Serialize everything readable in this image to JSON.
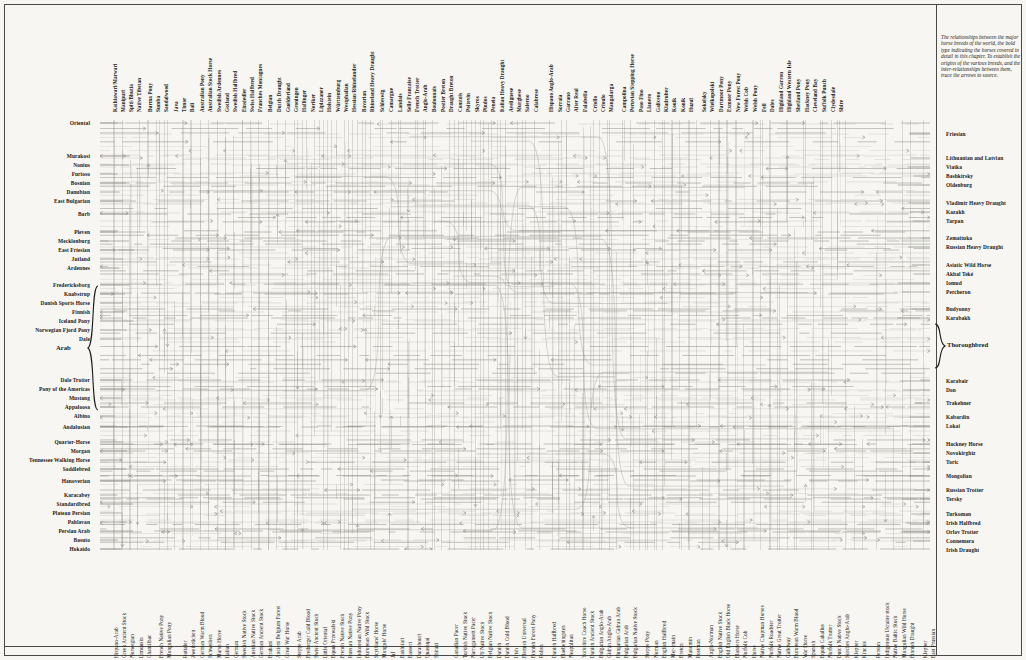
{
  "plate": {
    "title": "Horse Breed Relationship Chart",
    "caption": "The relationships between the major horse breeds of the world, the bold type indicating the horses covered in detail in this chapter. To establish the origins of the various breeds, and the inter-relationships between them, trace the arrows to source.",
    "bg_color": "#f7f6f2",
    "line_color": "#8a8a84",
    "text_color": "#171717",
    "rule_color": "#4a4a46"
  },
  "left_labels": [
    {
      "label": "Oriental",
      "y": 123,
      "bold": true
    },
    {
      "label": "Murakosi",
      "y": 156,
      "bold": true
    },
    {
      "label": "Nonius",
      "y": 165,
      "bold": true
    },
    {
      "label": "Furioso",
      "y": 174,
      "bold": true
    },
    {
      "label": "Bosnian",
      "y": 183,
      "bold": true
    },
    {
      "label": "Danubian",
      "y": 192,
      "bold": true
    },
    {
      "label": "East Bulgarian",
      "y": 201,
      "bold": true
    },
    {
      "label": "Barb",
      "y": 214,
      "bold": true
    },
    {
      "label": "Pleven",
      "y": 232,
      "bold": true
    },
    {
      "label": "Mecklenburg",
      "y": 241,
      "bold": true
    },
    {
      "label": "East Friesian",
      "y": 250,
      "bold": true
    },
    {
      "label": "Jutland",
      "y": 259,
      "bold": true
    },
    {
      "label": "Ardennes",
      "y": 268,
      "bold": true
    },
    {
      "label": "Fredericksborg",
      "y": 285,
      "bold": true
    },
    {
      "label": "Knabstrup",
      "y": 294,
      "bold": true
    },
    {
      "label": "Danish Sports Horse",
      "y": 303,
      "bold": true
    },
    {
      "label": "Finnish",
      "y": 312,
      "bold": true
    },
    {
      "label": "Iceland Pony",
      "y": 321,
      "bold": true
    },
    {
      "label": "Norwegian Fjord Pony",
      "y": 330,
      "bold": true
    },
    {
      "label": "Dale",
      "y": 339,
      "bold": true
    },
    {
      "label": "Dale Trotter",
      "y": 380,
      "bold": true
    },
    {
      "label": "Pony of the Americas",
      "y": 389,
      "bold": true
    },
    {
      "label": "Mustang",
      "y": 398,
      "bold": true
    },
    {
      "label": "Appaloosa",
      "y": 407,
      "bold": true
    },
    {
      "label": "Albino",
      "y": 416,
      "bold": true
    },
    {
      "label": "Andalusian",
      "y": 427,
      "bold": true
    },
    {
      "label": "Quarter-Horse",
      "y": 442,
      "bold": true
    },
    {
      "label": "Morgan",
      "y": 451,
      "bold": true
    },
    {
      "label": "Tennessee Walking Horse",
      "y": 460,
      "bold": true
    },
    {
      "label": "Saddlebred",
      "y": 469,
      "bold": true
    },
    {
      "label": "Hanoverian",
      "y": 481,
      "bold": true
    },
    {
      "label": "Karacabey",
      "y": 495,
      "bold": true
    },
    {
      "label": "Standardbred",
      "y": 504,
      "bold": true
    },
    {
      "label": "Plateau Persian",
      "y": 513,
      "bold": true
    },
    {
      "label": "Pahlavan",
      "y": 522,
      "bold": true
    },
    {
      "label": "Persian Arab",
      "y": 531,
      "bold": true
    },
    {
      "label": "Basuto",
      "y": 540,
      "bold": true
    },
    {
      "label": "Hokaido",
      "y": 549,
      "bold": true
    }
  ],
  "left_brace_label": {
    "label": "Arab",
    "y": 348
  },
  "right_brace_label": {
    "label": "Thoroughbred",
    "y": 343
  },
  "right_labels": [
    {
      "label": "Friesian",
      "y": 134,
      "bold": true
    },
    {
      "label": "Lithuanian and Latvian",
      "y": 158,
      "bold": true
    },
    {
      "label": "Viatka",
      "y": 167,
      "bold": true
    },
    {
      "label": "Bashkirsky",
      "y": 176,
      "bold": true
    },
    {
      "label": "Oldenburg",
      "y": 185,
      "bold": true
    },
    {
      "label": "Vladimir Heavy Draught",
      "y": 203,
      "bold": true
    },
    {
      "label": "Kazakh",
      "y": 212,
      "bold": true
    },
    {
      "label": "Tarpan",
      "y": 221,
      "bold": true
    },
    {
      "label": "Zemaituka",
      "y": 238,
      "bold": true
    },
    {
      "label": "Russian Heavy Draught",
      "y": 247,
      "bold": true
    },
    {
      "label": "Asiatic Wild Horse",
      "y": 265,
      "bold": true
    },
    {
      "label": "Akhal Teké",
      "y": 274,
      "bold": true
    },
    {
      "label": "Iomud",
      "y": 283,
      "bold": true
    },
    {
      "label": "Percheron",
      "y": 292,
      "bold": true
    },
    {
      "label": "Budyonny",
      "y": 309,
      "bold": true
    },
    {
      "label": "Karabakh",
      "y": 318,
      "bold": true
    },
    {
      "label": "Karabair",
      "y": 381,
      "bold": true
    },
    {
      "label": "Don",
      "y": 390,
      "bold": true
    },
    {
      "label": "Trakehner",
      "y": 403,
      "bold": true
    },
    {
      "label": "Kabardin",
      "y": 417,
      "bold": true
    },
    {
      "label": "Lokai",
      "y": 426,
      "bold": true
    },
    {
      "label": "Hackney Horse",
      "y": 444,
      "bold": true
    },
    {
      "label": "Novokirghiz",
      "y": 453,
      "bold": true
    },
    {
      "label": "Toric",
      "y": 462,
      "bold": true
    },
    {
      "label": "Mongolian",
      "y": 476,
      "bold": true
    },
    {
      "label": "Russian Trotter",
      "y": 490,
      "bold": true
    },
    {
      "label": "Tersky",
      "y": 499,
      "bold": true
    },
    {
      "label": "Turkoman",
      "y": 514,
      "bold": true
    },
    {
      "label": "Irish Halfbred",
      "y": 523,
      "bold": true
    },
    {
      "label": "Orlov Trotter",
      "y": 532,
      "bold": true
    },
    {
      "label": "Connemara",
      "y": 541,
      "bold": true
    },
    {
      "label": "Irish Draught",
      "y": 550,
      "bold": true
    }
  ],
  "top_labels": [
    {
      "label": "Kathiawari/Marwari",
      "x": 111
    },
    {
      "label": "Manipuri",
      "x": 119
    },
    {
      "label": "Spiti/Bhutia",
      "x": 127
    },
    {
      "label": "Native Tibetan",
      "x": 135
    },
    {
      "label": "Burma Pony",
      "x": 146
    },
    {
      "label": "Sumba",
      "x": 154
    },
    {
      "label": "Sandalwood",
      "x": 162
    },
    {
      "label": "Java",
      "x": 172
    },
    {
      "label": "Timor",
      "x": 180
    },
    {
      "label": "Bali",
      "x": 188
    },
    {
      "label": "Australian Pony",
      "x": 198
    },
    {
      "label": "Australian Stock Horse",
      "x": 206
    },
    {
      "label": "Swedish Ardennes",
      "x": 215
    },
    {
      "label": "Gotland",
      "x": 223
    },
    {
      "label": "Swedish Halfbred",
      "x": 231
    },
    {
      "label": "Einsiedler",
      "x": 240
    },
    {
      "label": "Swiss Halfbred",
      "x": 248
    },
    {
      "label": "Franches Montagnes",
      "x": 256
    },
    {
      "label": "Belgian",
      "x": 266
    },
    {
      "label": "Dutch Draught",
      "x": 275
    },
    {
      "label": "Guelderland",
      "x": 284
    },
    {
      "label": "Groningen",
      "x": 292
    },
    {
      "label": "Haflinger",
      "x": 300
    },
    {
      "label": "Noriker",
      "x": 309
    },
    {
      "label": "Lipizzaner",
      "x": 317
    },
    {
      "label": "Holstein",
      "x": 325
    },
    {
      "label": "Württemburg",
      "x": 334
    },
    {
      "label": "Westphalian",
      "x": 342
    },
    {
      "label": "Hessian/Rhinelander",
      "x": 350
    },
    {
      "label": "Bavarian",
      "x": 360
    },
    {
      "label": "Rhineland Heavy Draught",
      "x": 368
    },
    {
      "label": "Schleswig",
      "x": 378
    },
    {
      "label": "Camargue",
      "x": 387
    },
    {
      "label": "Landais",
      "x": 396
    },
    {
      "label": "Selle Francaise",
      "x": 405
    },
    {
      "label": "French Trotter",
      "x": 413
    },
    {
      "label": "Anglo-Arab",
      "x": 421
    },
    {
      "label": "Boulonnais",
      "x": 430
    },
    {
      "label": "Postier Breton",
      "x": 439
    },
    {
      "label": "Draught Breton",
      "x": 447
    },
    {
      "label": "Comtois",
      "x": 456
    },
    {
      "label": "Poitevin",
      "x": 464
    },
    {
      "label": "Skyros",
      "x": 473
    },
    {
      "label": "Pindos",
      "x": 481
    },
    {
      "label": "Peneia",
      "x": 489
    },
    {
      "label": "Italian Heavy Draught",
      "x": 498
    },
    {
      "label": "Avelignese",
      "x": 507
    },
    {
      "label": "Murghese",
      "x": 515
    },
    {
      "label": "Salerno",
      "x": 523
    },
    {
      "label": "Calabrese",
      "x": 532
    },
    {
      "label": "Hispano Anglo-Arab",
      "x": 547
    },
    {
      "label": "Sorraia",
      "x": 556
    },
    {
      "label": "Garrano",
      "x": 564
    },
    {
      "label": "Alter Real",
      "x": 572
    },
    {
      "label": "Falabella",
      "x": 581
    },
    {
      "label": "Criollo",
      "x": 591
    },
    {
      "label": "Crioulo",
      "x": 599
    },
    {
      "label": "Mangalarga",
      "x": 607
    },
    {
      "label": "Campolina",
      "x": 620
    },
    {
      "label": "Peruvian Stepping Horse",
      "x": 628
    },
    {
      "label": "Paso Fino",
      "x": 637
    },
    {
      "label": "Llanero",
      "x": 645
    },
    {
      "label": "Galiceno",
      "x": 654
    },
    {
      "label": "Kladruber",
      "x": 662
    },
    {
      "label": "Kouik",
      "x": 670
    },
    {
      "label": "Konik",
      "x": 679
    },
    {
      "label": "Huzul",
      "x": 687
    },
    {
      "label": "Sokolsky",
      "x": 700
    },
    {
      "label": "Wielkopolski",
      "x": 708
    },
    {
      "label": "Dartmoor Pony",
      "x": 717
    },
    {
      "label": "Exmoor Pony",
      "x": 725
    },
    {
      "label": "New Forest Pony",
      "x": 734
    },
    {
      "label": "Welsh Cob",
      "x": 742
    },
    {
      "label": "Welsh Pony",
      "x": 751
    },
    {
      "label": "Fell",
      "x": 760
    },
    {
      "label": "Dales",
      "x": 768
    },
    {
      "label": "Highland Garron",
      "x": 777
    },
    {
      "label": "Highland Western Isle",
      "x": 785
    },
    {
      "label": "Shetland Pony",
      "x": 794
    },
    {
      "label": "Hackney Pony",
      "x": 803
    },
    {
      "label": "Cleveland Bay",
      "x": 811
    },
    {
      "label": "Suffolk Punch",
      "x": 820
    },
    {
      "label": "Clydesdale",
      "x": 829
    },
    {
      "label": "Shire",
      "x": 837
    }
  ],
  "bottom_labels": [
    {
      "label": "Hispano-Arab",
      "x": 112
    },
    {
      "label": "Greek Ancient Stock",
      "x": 120
    },
    {
      "label": "Norwegian",
      "x": 128
    },
    {
      "label": "Limousin",
      "x": 137
    },
    {
      "label": "Chantilhac",
      "x": 145
    },
    {
      "label": "French Native Pony",
      "x": 157
    },
    {
      "label": "Mongolian Pony",
      "x": 165
    },
    {
      "label": "Rottaler",
      "x": 181
    },
    {
      "label": "Zweibrücken",
      "x": 189
    },
    {
      "label": "German Warm Blood",
      "x": 198
    },
    {
      "label": "Schweiken",
      "x": 206
    },
    {
      "label": "Marsh Horse",
      "x": 215
    },
    {
      "label": "Italian",
      "x": 223
    },
    {
      "label": "German",
      "x": 232
    },
    {
      "label": "Swedish Native Stock",
      "x": 240
    },
    {
      "label": "Austrian Native Stock",
      "x": 249
    },
    {
      "label": "German Ancient Stock",
      "x": 257
    },
    {
      "label": "Brabant",
      "x": 266
    },
    {
      "label": "Ancient Belgium Forest",
      "x": 274
    },
    {
      "label": "Great War Horse",
      "x": 283
    },
    {
      "label": "Steppe Arab",
      "x": 295
    },
    {
      "label": "Freiberger Cold Blood",
      "x": 304
    },
    {
      "label": "Swiss Ancient Stock",
      "x": 312
    },
    {
      "label": "Little Oriental",
      "x": 321
    },
    {
      "label": "Equus Przewalski",
      "x": 329
    },
    {
      "label": "French Native Stock",
      "x": 338
    },
    {
      "label": "Russian Native Pony",
      "x": 346
    },
    {
      "label": "Indonesian Native Pony",
      "x": 355
    },
    {
      "label": "European Wild Stock",
      "x": 363
    },
    {
      "label": "Scythians' Horse",
      "x": 372
    },
    {
      "label": "Mongols' Horse",
      "x": 380
    },
    {
      "label": "Jaf",
      "x": 389
    },
    {
      "label": "Bakhtiari",
      "x": 398
    },
    {
      "label": "Basseri",
      "x": 406
    },
    {
      "label": "Darashouri",
      "x": 415
    },
    {
      "label": "Quashqai",
      "x": 423
    },
    {
      "label": "Shirazi",
      "x": 432
    },
    {
      "label": "Canadian Pacer",
      "x": 452
    },
    {
      "label": "Turkish Native Stock",
      "x": 461
    },
    {
      "label": "Narragansett Pacer",
      "x": 469
    },
    {
      "label": "US Native Stock",
      "x": 478
    },
    {
      "label": "Belgian Native Stock",
      "x": 486
    },
    {
      "label": "Danish",
      "x": 495
    },
    {
      "label": "Danish Cold Blood",
      "x": 503
    },
    {
      "label": "Irish",
      "x": 512
    },
    {
      "label": "Flemish Universal",
      "x": 520
    },
    {
      "label": "Finnish Forest Pony",
      "x": 529
    },
    {
      "label": "Polish",
      "x": 537
    },
    {
      "label": "Danish Halfbred",
      "x": 550
    },
    {
      "label": "Flaebehingsten",
      "x": 559
    },
    {
      "label": "Neapolitan",
      "x": 567
    },
    {
      "label": "Yorkshire Coach Horse",
      "x": 580
    },
    {
      "label": "Danish Ancient Stock",
      "x": 588
    },
    {
      "label": "Bulgarian Anglo-Arab",
      "x": 597
    },
    {
      "label": "Gidran Anglo-Arab",
      "x": 605
    },
    {
      "label": "Hungarian Gidran Arab",
      "x": 614
    },
    {
      "label": "Bulgarian Arab",
      "x": 622
    },
    {
      "label": "Bulgarian Native Stock",
      "x": 631
    },
    {
      "label": "Steppe Pony",
      "x": 643
    },
    {
      "label": "Norman",
      "x": 652
    },
    {
      "label": "English Halfbred",
      "x": 660
    },
    {
      "label": "Mer-lmain",
      "x": 669
    },
    {
      "label": "Breton",
      "x": 677
    },
    {
      "label": "Manomin",
      "x": 686
    },
    {
      "label": "Postman",
      "x": 694
    },
    {
      "label": "Anglo-Norman",
      "x": 707
    },
    {
      "label": "English Native Stock",
      "x": 716
    },
    {
      "label": "Old English Black Horse",
      "x": 724
    },
    {
      "label": "Flanders Horse",
      "x": 733
    },
    {
      "label": "Norfolk Cob",
      "x": 741
    },
    {
      "label": "Horse",
      "x": 750
    },
    {
      "label": "Native Chapman Horses",
      "x": 758
    },
    {
      "label": "Norfolk Roadster",
      "x": 767
    },
    {
      "label": "Native Great Trotter",
      "x": 775
    },
    {
      "label": "Galloway",
      "x": 784
    },
    {
      "label": "European Warm Blood",
      "x": 792
    },
    {
      "label": "War Horse",
      "x": 801
    },
    {
      "label": "Spanish",
      "x": 809
    },
    {
      "label": "Equus Caballus",
      "x": 818
    },
    {
      "label": "Norfolk Trotter",
      "x": 826
    },
    {
      "label": "Dutch Native Stock",
      "x": 835
    },
    {
      "label": "Sorches Anglo-Arab",
      "x": 843
    },
    {
      "label": "Klepper",
      "x": 852
    },
    {
      "label": "Kinchis",
      "x": 860
    },
    {
      "label": "Persian",
      "x": 874
    },
    {
      "label": "Indigenous Ukraine stock",
      "x": 883
    },
    {
      "label": "Native Baltic Stock",
      "x": 891
    },
    {
      "label": "Mongolian Wild Horse",
      "x": 900
    },
    {
      "label": "Finnish Draught",
      "x": 908
    },
    {
      "label": "Klepper",
      "x": 921
    },
    {
      "label": "East Prussian",
      "x": 929
    }
  ],
  "chart_data": {
    "type": "diagram",
    "n_vertical_lines": 86,
    "n_horizontal_lines": 70,
    "grid": true
  }
}
